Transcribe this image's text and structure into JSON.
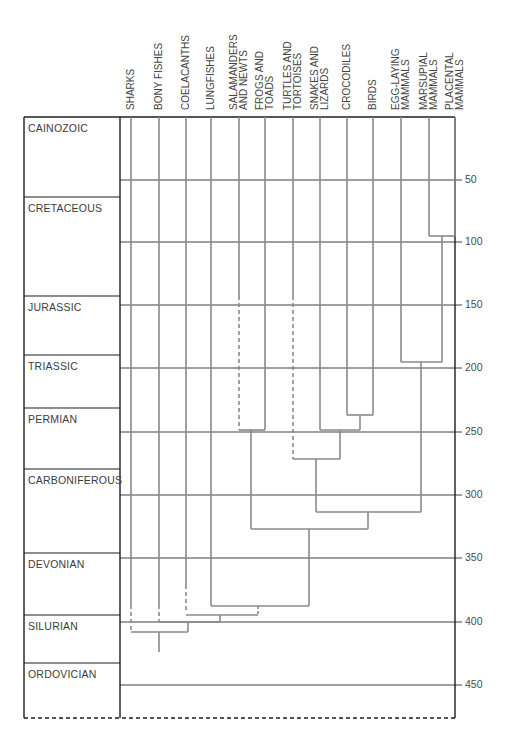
{
  "columns": [
    {
      "label": "SHARKS",
      "x": 131
    },
    {
      "label": "BONY FISHES",
      "x": 159
    },
    {
      "label": "COELACANTHS",
      "x": 186
    },
    {
      "label": "LUNGFISHES",
      "x": 211
    },
    {
      "label": "SALAMANDERS\nAND NEWTS",
      "x": 239
    },
    {
      "label": "FROGS AND\nTOADS",
      "x": 265
    },
    {
      "label": "TURTLES AND\nTORTOISES",
      "x": 293
    },
    {
      "label": "SNAKES AND\nLIZARDS",
      "x": 320
    },
    {
      "label": "CROCODILES",
      "x": 347
    },
    {
      "label": "BIRDS",
      "x": 373
    },
    {
      "label": "EGG-LAYING\nMAMMALS",
      "x": 401
    },
    {
      "label": "MARSUPIAL\nMAMMALS",
      "x": 429
    },
    {
      "label": "PLACENTAL\nMAMMALS",
      "x": 455
    }
  ],
  "periods": [
    {
      "label": "CAINOZOIC",
      "top": 117,
      "bottom": 197
    },
    {
      "label": "CRETACEOUS",
      "top": 197,
      "bottom": 296
    },
    {
      "label": "JURASSIC",
      "top": 296,
      "bottom": 355
    },
    {
      "label": "TRIASSIC",
      "top": 355,
      "bottom": 408
    },
    {
      "label": "PERMIAN",
      "top": 408,
      "bottom": 469
    },
    {
      "label": "CARBONIFEROUS",
      "top": 469,
      "bottom": 553
    },
    {
      "label": "DEVONIAN",
      "top": 553,
      "bottom": 615
    },
    {
      "label": "SILURIAN",
      "top": 615,
      "bottom": 663
    },
    {
      "label": "ORDOVICIAN",
      "top": 663,
      "bottom": 718
    }
  ],
  "axis": {
    "unit": "million years ago",
    "ticks": [
      {
        "label": "50",
        "y": 180
      },
      {
        "label": "100",
        "y": 242
      },
      {
        "label": "150",
        "y": 305
      },
      {
        "label": "200",
        "y": 368
      },
      {
        "label": "250",
        "y": 432
      },
      {
        "label": "300",
        "y": 495
      },
      {
        "label": "350",
        "y": 558
      },
      {
        "label": "400",
        "y": 622
      },
      {
        "label": "450",
        "y": 685
      }
    ]
  },
  "colors": {
    "frame": "#1e1e1e",
    "gridline": "#2a2a2a",
    "branch": "#8a8a8a"
  }
}
